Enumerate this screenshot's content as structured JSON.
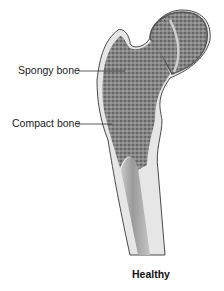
{
  "diagram": {
    "labels": [
      {
        "id": "spongy",
        "text": "Spongy bone"
      },
      {
        "id": "compact",
        "text": "Compact bone"
      }
    ],
    "caption": "Healthy"
  },
  "colors": {
    "outline": "#4a4a4a",
    "compact_bone": "#e6e6e6",
    "spongy_bone": "#7a7a7a",
    "marrow_cavity": "#a8a8a8",
    "label_text": "#222222"
  }
}
